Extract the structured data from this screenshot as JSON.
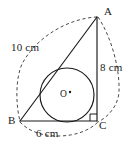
{
  "figure": {
    "shape_type": "geometry-diagram",
    "colors": {
      "stroke": "#1a1a1a",
      "dashed_stroke": "#4a4a4a",
      "background": "#ffffff"
    },
    "vertices": [
      {
        "name": "A",
        "label": "A",
        "x": 97,
        "y": 17
      },
      {
        "name": "B",
        "label": "B",
        "x": 20,
        "y": 121
      },
      {
        "name": "C",
        "label": "C",
        "x": 97,
        "y": 121
      }
    ],
    "center": {
      "name": "O",
      "label": "O",
      "x": 67,
      "y": 95
    },
    "incircle": {
      "cx": 67,
      "cy": 95,
      "r": 27
    },
    "right_angle_at": "C",
    "dimensions": [
      {
        "side": "AB",
        "label": "10 cm",
        "value": 10,
        "unit": "cm"
      },
      {
        "side": "AC",
        "label": "8 cm",
        "value": 8,
        "unit": "cm"
      },
      {
        "side": "BC",
        "label": "6 cm",
        "value": 6,
        "unit": "cm"
      }
    ],
    "dashed_arcs": [
      {
        "name": "arc-A-to-B",
        "from": "A",
        "to": "B",
        "bulge": "outward-upper-left"
      },
      {
        "name": "arc-A-to-C",
        "from": "A",
        "to": "C",
        "bulge": "outward-right"
      },
      {
        "name": "arc-B-to-C",
        "from": "B",
        "to": "C",
        "bulge": "outward-below"
      }
    ]
  }
}
